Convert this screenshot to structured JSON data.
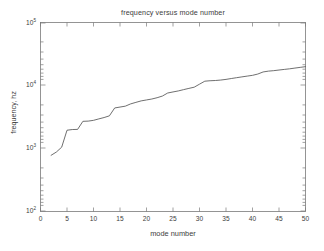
{
  "chart_data": {
    "type": "line",
    "title": "frequency versus mode number",
    "xlabel": "mode number",
    "ylabel": "frequency, hz",
    "xscale": "linear",
    "yscale": "log",
    "xlim": [
      0,
      50
    ],
    "ylim": [
      100,
      100000
    ],
    "grid": false,
    "legend": null,
    "line_color": "#555555",
    "background_color": "#ffffff",
    "xticks": [
      0,
      5,
      10,
      15,
      20,
      25,
      30,
      35,
      40,
      45,
      50
    ],
    "xtick_labels": [
      "0",
      "5",
      "10",
      "15",
      "20",
      "25",
      "30",
      "35",
      "40",
      "45",
      "50"
    ],
    "yticks": [
      100,
      1000,
      10000,
      100000
    ],
    "ytick_labels": [
      "10",
      "10",
      "10",
      "10"
    ],
    "ytick_exponents": [
      "2",
      "3",
      "4",
      "5"
    ],
    "x": [
      2,
      3,
      4,
      5,
      6,
      7,
      8,
      9,
      10,
      11,
      12,
      13,
      14,
      15,
      16,
      17,
      18,
      19,
      20,
      21,
      22,
      23,
      24,
      25,
      26,
      27,
      28,
      29,
      30,
      31,
      32,
      33,
      34,
      35,
      36,
      37,
      38,
      39,
      40,
      41,
      42,
      43,
      44,
      45,
      46,
      47,
      48,
      49,
      50
    ],
    "values": [
      780,
      880,
      1050,
      1950,
      2000,
      2010,
      2700,
      2720,
      2800,
      2950,
      3100,
      3300,
      4400,
      4550,
      4700,
      5100,
      5400,
      5700,
      5900,
      6100,
      6400,
      6800,
      7600,
      7900,
      8200,
      8600,
      9000,
      9400,
      10500,
      11700,
      11900,
      12000,
      12200,
      12500,
      12900,
      13300,
      13700,
      14100,
      14500,
      15200,
      16400,
      16900,
      17200,
      17600,
      18000,
      18400,
      18900,
      19400,
      19900
    ]
  },
  "axes": {
    "ytick_0": {
      "mantissa": "10",
      "exponent": "5"
    },
    "ytick_1": {
      "mantissa": "10",
      "exponent": "4"
    },
    "ytick_2": {
      "mantissa": "10",
      "exponent": "3"
    },
    "ytick_3": {
      "mantissa": "10",
      "exponent": "2"
    }
  }
}
